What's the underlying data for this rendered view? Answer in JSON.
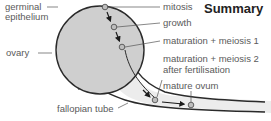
{
  "title": "Summary",
  "labels": {
    "germinal_epithelium_1": "germinal",
    "germinal_epithelium_2": "epithelium",
    "ovary": "ovary",
    "fallopian_tube": "fallopian tube",
    "mitosis": "mitosis",
    "growth": "growth",
    "maturation_meiosis_1": "maturation + meiosis 1",
    "maturation_meiosis_2_a": "maturation + meiosis 2",
    "maturation_meiosis_2_b": "after fertilisation",
    "mature_ovum": "mature ovum"
  },
  "colors": {
    "ovary_fill": "#cfcfcf",
    "tube_fill": "#ececec",
    "outline": "#2a2a2a",
    "cell_fill": "#bdbdbd",
    "label_text": "#5a5a5a",
    "leader_line": "#555555"
  }
}
